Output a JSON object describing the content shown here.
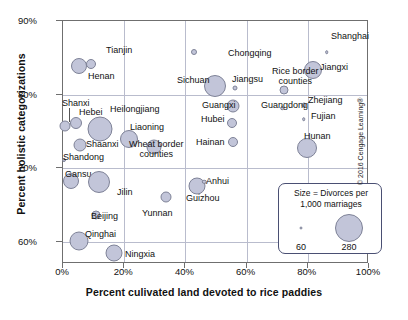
{
  "chart_data": {
    "type": "scatter",
    "title": "",
    "xlabel": "Percent culivated land devoted to rice paddies",
    "ylabel": "Percent holistic categorizations",
    "xlim": [
      0,
      100
    ],
    "ylim": [
      57,
      90
    ],
    "xticks": [
      "0%",
      "20%",
      "40%",
      "60%",
      "80%",
      "100%"
    ],
    "xtick_values": [
      0,
      20,
      40,
      60,
      80,
      100
    ],
    "yticks": [
      "90%",
      "80%",
      "70%",
      "60%"
    ],
    "ytick_values": [
      90,
      80,
      70,
      60
    ],
    "grid": true,
    "legend": {
      "title_line1": "Size = Divorces per",
      "title_line2": "1,000 marriages",
      "small_value": "60",
      "large_value": "280",
      "position": "inside-bottom-right"
    },
    "size_encoding": "Divorces per 1,000 marriages",
    "bubble_fill": "#c2c5d9",
    "bubble_stroke": "#7e8297",
    "points": [
      {
        "label": "Tianjin",
        "x": 9.5,
        "y": 84.0,
        "size": 180,
        "r": 5.0,
        "lx": 106,
        "ly": 45,
        "anchor": "left"
      },
      {
        "label": "Henan",
        "x": 5.5,
        "y": 83.8,
        "size": 250,
        "r": 8.0,
        "lx": 88,
        "ly": 71,
        "anchor": "left"
      },
      {
        "label": "Chongqing",
        "x": 43.0,
        "y": 85.7,
        "size": 70,
        "r": 3.0,
        "lx": 228,
        "ly": 48,
        "anchor": "left"
      },
      {
        "label": "Shanghai",
        "x": 86.5,
        "y": 85.6,
        "size": 50,
        "r": 1.8,
        "lx": 331,
        "ly": 31,
        "anchor": "left"
      },
      {
        "label": "Jiangxi",
        "x": 82.0,
        "y": 83.2,
        "size": 230,
        "r": 9.0,
        "lx": 320,
        "ly": 62,
        "anchor": "left"
      },
      {
        "label": "Sichuan",
        "x": 50.0,
        "y": 81.0,
        "size": 270,
        "r": 11.0,
        "lx": 177,
        "ly": 75,
        "anchor": "left"
      },
      {
        "label": "Jiangsu",
        "x": 56.5,
        "y": 80.8,
        "size": 60,
        "r": 2.5,
        "lx": 232,
        "ly": 74,
        "anchor": "left"
      },
      {
        "label": "Rice border counties",
        "x": 72.5,
        "y": 80.5,
        "size": 110,
        "r": 4.5,
        "lx": 272,
        "ly": 66,
        "anchor": "left"
      },
      {
        "label": "Zhejiang",
        "x": 79.0,
        "y": 78.5,
        "size": 60,
        "r": 2.5,
        "lx": 308,
        "ly": 95,
        "anchor": "left"
      },
      {
        "label": "Guangxi",
        "x": 56.0,
        "y": 78.3,
        "size": 190,
        "r": 6.5,
        "lx": 202,
        "ly": 100,
        "anchor": "left"
      },
      {
        "label": "Guangdong",
        "x": 72.0,
        "y": 78.0,
        "size": 50,
        "r": 1.8,
        "lx": 261,
        "ly": 100,
        "anchor": "left"
      },
      {
        "label": "Fujian",
        "x": 79.0,
        "y": 76.5,
        "size": 50,
        "r": 1.8,
        "lx": 311,
        "ly": 111,
        "anchor": "left"
      },
      {
        "label": "Hubei",
        "x": 55.5,
        "y": 76.0,
        "size": 130,
        "r": 5.0,
        "lx": 201,
        "ly": 114,
        "anchor": "left"
      },
      {
        "label": "Shanxi",
        "x": 1.0,
        "y": 75.6,
        "size": 150,
        "r": 5.5,
        "lx": 62,
        "ly": 98,
        "anchor": "left"
      },
      {
        "label": "Hebei",
        "x": 4.5,
        "y": 76.0,
        "size": 160,
        "r": 6.0,
        "lx": 79,
        "ly": 107,
        "anchor": "left"
      },
      {
        "label": "Heilongjiang",
        "x": 12.5,
        "y": 75.2,
        "size": 290,
        "r": 12.5,
        "lx": 110,
        "ly": 104,
        "anchor": "left"
      },
      {
        "label": "Liaoning",
        "x": 22.0,
        "y": 73.8,
        "size": 230,
        "r": 9.0,
        "lx": 130,
        "ly": 122,
        "anchor": "left"
      },
      {
        "label": "Hainan",
        "x": 56.0,
        "y": 73.4,
        "size": 130,
        "r": 5.0,
        "lx": 196,
        "ly": 137,
        "anchor": "left"
      },
      {
        "label": "Hunan",
        "x": 80.0,
        "y": 72.6,
        "size": 250,
        "r": 10.0,
        "lx": 304,
        "ly": 131,
        "anchor": "left"
      },
      {
        "label": "Wheat border counties",
        "x": 30.0,
        "y": 72.8,
        "size": 200,
        "r": 7.5,
        "lx": 129,
        "ly": 139,
        "anchor": "left"
      },
      {
        "label": "Shaanxi",
        "x": 6.0,
        "y": 73.0,
        "size": 170,
        "r": 6.5,
        "lx": 86,
        "ly": 139,
        "anchor": "left"
      },
      {
        "label": "Shandong",
        "x": 0.5,
        "y": 71.0,
        "size": 45,
        "r": 2.0,
        "lx": 63,
        "ly": 152,
        "anchor": "left"
      },
      {
        "label": "Gansu",
        "x": 3.0,
        "y": 68.2,
        "size": 210,
        "r": 8.0,
        "lx": 65,
        "ly": 169,
        "anchor": "left"
      },
      {
        "label": "Jilin",
        "x": 12.0,
        "y": 68.0,
        "size": 270,
        "r": 11.0,
        "lx": 117,
        "ly": 187,
        "anchor": "left"
      },
      {
        "label": "Guizhou",
        "x": 44.0,
        "y": 67.4,
        "size": 220,
        "r": 8.5,
        "lx": 186,
        "ly": 193,
        "anchor": "left"
      },
      {
        "label": "Anhui",
        "x": 46.5,
        "y": 68.0,
        "size": 55,
        "r": 2.2,
        "lx": 206,
        "ly": 176,
        "anchor": "left"
      },
      {
        "label": "Yunnan",
        "x": 34.0,
        "y": 66.0,
        "size": 150,
        "r": 5.5,
        "lx": 142,
        "ly": 208,
        "anchor": "left"
      },
      {
        "label": "Beijing",
        "x": 11.0,
        "y": 63.5,
        "size": 120,
        "r": 4.5,
        "lx": 91,
        "ly": 211,
        "anchor": "left"
      },
      {
        "label": "Qinghai",
        "x": 5.5,
        "y": 60.0,
        "size": 240,
        "r": 9.5,
        "lx": 85,
        "ly": 229,
        "anchor": "left"
      },
      {
        "label": "Ningxia",
        "x": 17.0,
        "y": 58.3,
        "size": 220,
        "r": 8.5,
        "lx": 125,
        "ly": 249,
        "anchor": "left"
      }
    ]
  },
  "credit": "© 2016 Cengage Learning®"
}
